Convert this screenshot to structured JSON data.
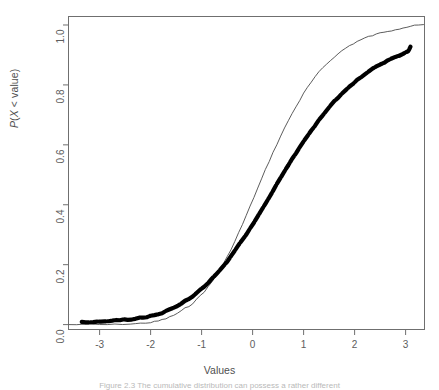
{
  "figure": {
    "background_color": "#ffffff",
    "frame_color": "#6f6f6f",
    "caption": "Figure  2.3   The cumulative distribution can possess a rather different"
  },
  "axes": {
    "x_title": "Values",
    "y_title_prefix": "P",
    "y_title_open": "(",
    "y_title_var": "X",
    "y_title_rest": " < value)",
    "x_ticks": [
      "-3",
      "-2",
      "-1",
      "0",
      "1",
      "2",
      "3"
    ],
    "y_ticks": [
      "0.0",
      "0.2",
      "0.4",
      "0.6",
      "0.8",
      "1.0"
    ]
  },
  "chart_data": {
    "type": "line",
    "title": "",
    "xlabel": "Values",
    "ylabel": "P(X < value)",
    "xlim": [
      -3.62,
      3.38
    ],
    "ylim": [
      -0.018,
      1.03
    ],
    "xticks": [
      -3,
      -2,
      -1,
      0,
      1,
      2,
      3
    ],
    "yticks": [
      0.0,
      0.2,
      0.4,
      0.6,
      0.8,
      1.0
    ],
    "grid": false,
    "legend": "none",
    "series": [
      {
        "name": "empirical-cdf-thin",
        "style": "thin-line",
        "color": "#4a4a4a",
        "linewidth": 0.9,
        "x": [
          -3.6,
          -3.3,
          -3.0,
          -2.7,
          -2.4,
          -2.2,
          -2.0,
          -1.85,
          -1.7,
          -1.55,
          -1.4,
          -1.25,
          -1.1,
          -0.95,
          -0.8,
          -0.65,
          -0.5,
          -0.35,
          -0.2,
          -0.05,
          0.1,
          0.25,
          0.4,
          0.55,
          0.7,
          0.85,
          1.0,
          1.15,
          1.3,
          1.45,
          1.6,
          1.75,
          1.9,
          2.05,
          2.2,
          2.35,
          2.5,
          2.65,
          2.8,
          2.95,
          3.1,
          3.25,
          3.35
        ],
        "y": [
          0.0,
          0.0,
          0.0,
          0.0,
          0.002,
          0.004,
          0.007,
          0.012,
          0.02,
          0.031,
          0.045,
          0.062,
          0.083,
          0.11,
          0.142,
          0.18,
          0.225,
          0.277,
          0.334,
          0.394,
          0.455,
          0.516,
          0.574,
          0.629,
          0.681,
          0.728,
          0.771,
          0.809,
          0.842,
          0.87,
          0.894,
          0.914,
          0.931,
          0.945,
          0.956,
          0.965,
          0.973,
          0.98,
          0.986,
          0.991,
          0.996,
          0.999,
          1.0
        ]
      },
      {
        "name": "theoretical-cdf-thick",
        "style": "thick-dotted-line",
        "color": "#000000",
        "linewidth": 4.2,
        "x": [
          -3.35,
          -3.2,
          -3.05,
          -2.9,
          -2.75,
          -2.6,
          -2.45,
          -2.3,
          -2.15,
          -2.0,
          -1.85,
          -1.7,
          -1.55,
          -1.4,
          -1.25,
          -1.1,
          -0.95,
          -0.8,
          -0.65,
          -0.5,
          -0.35,
          -0.2,
          -0.05,
          0.1,
          0.25,
          0.4,
          0.55,
          0.7,
          0.85,
          1.0,
          1.15,
          1.3,
          1.45,
          1.6,
          1.75,
          1.9,
          2.05,
          2.2,
          2.35,
          2.5,
          2.65,
          2.8,
          2.95,
          3.05,
          3.1
        ],
        "y": [
          0.008,
          0.009,
          0.01,
          0.011,
          0.013,
          0.015,
          0.017,
          0.02,
          0.024,
          0.029,
          0.036,
          0.045,
          0.056,
          0.07,
          0.086,
          0.105,
          0.127,
          0.152,
          0.18,
          0.211,
          0.245,
          0.282,
          0.321,
          0.362,
          0.404,
          0.447,
          0.49,
          0.532,
          0.573,
          0.612,
          0.649,
          0.683,
          0.715,
          0.744,
          0.771,
          0.795,
          0.817,
          0.836,
          0.853,
          0.868,
          0.881,
          0.893,
          0.903,
          0.912,
          0.93
        ]
      }
    ],
    "annotations": [
      {
        "text": "curves cross near x = 0.3",
        "visible": false
      }
    ]
  }
}
